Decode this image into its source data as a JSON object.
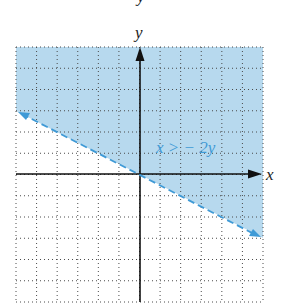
{
  "chart_data": {
    "type": "line",
    "title": "",
    "xlabel": "x",
    "ylabel": "y",
    "xlim": [
      -6,
      6
    ],
    "ylim": [
      -6,
      6
    ],
    "grid": true,
    "grid_style": "dotted",
    "series": [
      {
        "name": "boundary x = -2y",
        "style": "dashed",
        "x": [
          -6,
          6
        ],
        "y": [
          3,
          -3
        ]
      }
    ],
    "shaded_region": "x > -2y (above the line)",
    "annotations": [
      {
        "text": "x > − 2y",
        "x": 3.5,
        "y": 1.4
      }
    ],
    "colors": {
      "shade": "#b7d9ee",
      "boundary": "#3f9ad6",
      "axes": "#111111",
      "grid": "#555555"
    }
  },
  "labels": {
    "top_clipped": "y",
    "x_axis": "x",
    "y_axis": "y",
    "inequality": "x > − 2y"
  }
}
